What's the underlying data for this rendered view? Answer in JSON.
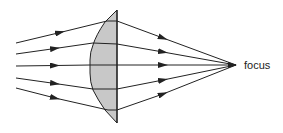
{
  "diagram": {
    "type": "converging-lens-ray-diagram",
    "focus_label": "focus",
    "colors": {
      "line": "#222222",
      "lens_fill": "#c8c8c8",
      "background": "#ffffff"
    },
    "lens": {
      "shape": "plano-convex",
      "flat_x": 117,
      "top_y": 10,
      "bottom_y": 123
    },
    "focus_point": {
      "x": 236,
      "y": 65
    },
    "rays": [
      {
        "start": [
          16,
          43
        ],
        "lens_in": [
          107,
          21
        ],
        "lens_out": [
          117,
          21
        ]
      },
      {
        "start": [
          16,
          54
        ],
        "lens_in": [
          93,
          43
        ],
        "lens_out": [
          117,
          44
        ]
      },
      {
        "start": [
          16,
          66
        ],
        "lens_in": [
          90,
          65
        ],
        "lens_out": [
          117,
          65
        ]
      },
      {
        "start": [
          16,
          78
        ],
        "lens_in": [
          93,
          89
        ],
        "lens_out": [
          117,
          89
        ]
      },
      {
        "start": [
          16,
          88
        ],
        "lens_in": [
          108,
          110
        ],
        "lens_out": [
          117,
          110
        ]
      }
    ],
    "ray_count": 5
  }
}
